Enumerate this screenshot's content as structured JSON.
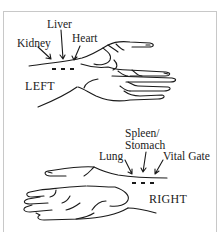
{
  "diagram": {
    "left_panel": {
      "side_label": "LEFT",
      "positions": [
        {
          "label": "Kidney"
        },
        {
          "label": "Liver"
        },
        {
          "label": "Heart"
        }
      ]
    },
    "right_panel": {
      "side_label": "RIGHT",
      "positions": [
        {
          "label": "Lung"
        },
        {
          "label": "Spleen/"
        },
        {
          "label": "Stomach"
        },
        {
          "label": "Vital Gate"
        }
      ]
    },
    "colors": {
      "ink": "#1a1a1a",
      "frame": "#c8c8c8",
      "background": "#ffffff"
    }
  }
}
